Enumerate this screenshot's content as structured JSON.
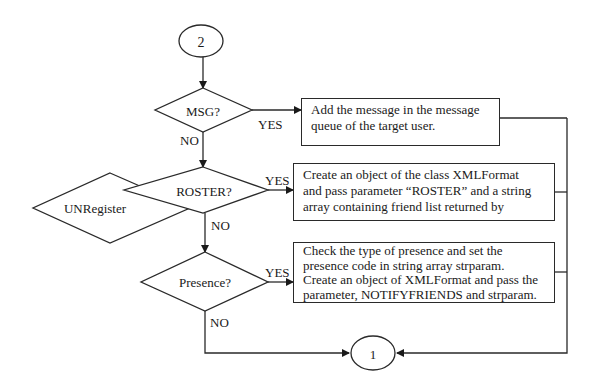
{
  "diagram": {
    "type": "flowchart",
    "connectors": {
      "start": "2",
      "end": "1"
    },
    "decisions": [
      {
        "id": "msg",
        "label": "MSG?",
        "yes": "YES",
        "no": "NO"
      },
      {
        "id": "roster",
        "label": "ROSTER?",
        "yes": "YES",
        "no": "NO"
      },
      {
        "id": "presence",
        "label": "Presence?",
        "yes": "YES",
        "no": "NO"
      },
      {
        "id": "unregister",
        "label": "UNRegister"
      }
    ],
    "processes": [
      {
        "id": "add-message",
        "lines": [
          "Add the message in the message",
          "queue of the target user."
        ]
      },
      {
        "id": "roster-action",
        "lines": [
          "Create an object of the class XMLFormat",
          "and pass parameter “ROSTER” and a string",
          "array containing friend list returned by"
        ]
      },
      {
        "id": "presence-action",
        "lines": [
          "Check the type of presence and set the",
          "presence code in string array strparam.",
          "Create an object of XMLFormat and pass the",
          "parameter, NOTIFYFRIENDS and strparam."
        ]
      }
    ]
  }
}
